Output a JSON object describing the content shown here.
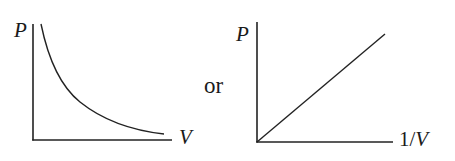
{
  "figure": {
    "left_graph": {
      "y_axis_label": "P",
      "x_axis_label": "V",
      "curve": "hyperbola (P ∝ 1/V)"
    },
    "connector_text": "or",
    "right_graph": {
      "y_axis_label": "P",
      "x_axis_label_prefix": "1/",
      "x_axis_label_var": "V",
      "curve": "straight line through origin"
    },
    "colors": {
      "line": "#222222",
      "background": "#ffffff"
    }
  }
}
